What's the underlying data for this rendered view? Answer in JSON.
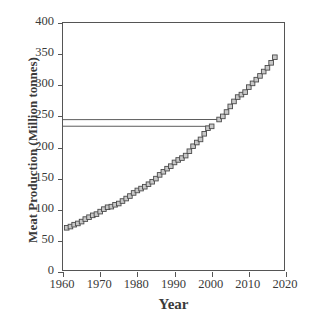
{
  "chart_data": {
    "type": "line",
    "title": "",
    "xlabel": "Year",
    "ylabel": "Meat Production (Million tonnes)",
    "xlim": [
      1960,
      2020
    ],
    "ylim": [
      0,
      400
    ],
    "xticks": [
      1960,
      1970,
      1980,
      1990,
      2000,
      2010,
      2020
    ],
    "xticklabels": [
      "1960",
      "1970",
      "1980",
      "1990",
      "2000",
      "2010",
      "2020"
    ],
    "yticks": [
      0,
      50,
      100,
      150,
      200,
      250,
      300,
      350,
      400
    ],
    "yticklabels": [
      "0",
      "50",
      "100",
      "150",
      "200",
      "250",
      "300",
      "350",
      "400"
    ],
    "grid": false,
    "legend": null,
    "marker": "square",
    "marker_facecolor": "#c8c8c8",
    "marker_edgecolor": "#4a4a4a",
    "line_color": "#4a4a4a",
    "series": [
      {
        "name": "Global meat production",
        "x": [
          1961,
          1962,
          1963,
          1964,
          1965,
          1966,
          1967,
          1968,
          1969,
          1970,
          1971,
          1972,
          1973,
          1974,
          1975,
          1976,
          1977,
          1978,
          1979,
          1980,
          1981,
          1982,
          1983,
          1984,
          1985,
          1986,
          1987,
          1988,
          1989,
          1990,
          1991,
          1992,
          1993,
          1994,
          1995,
          1996,
          1997,
          1998,
          1999,
          2000,
          1000,
          2002,
          2003,
          2004,
          2005,
          2006,
          2007,
          2008,
          2009,
          2010,
          2011,
          2012,
          2013,
          2014,
          2015,
          2016,
          2017
        ],
        "values": [
          71,
          73,
          76,
          78,
          81,
          85,
          88,
          91,
          93,
          97,
          101,
          104,
          105,
          108,
          110,
          114,
          118,
          122,
          127,
          131,
          134,
          137,
          141,
          145,
          150,
          156,
          161,
          166,
          170,
          176,
          180,
          183,
          187,
          194,
          202,
          208,
          213,
          222,
          231,
          234,
          239,
          245,
          250,
          257,
          266,
          274,
          281,
          285,
          289,
          297,
          303,
          309,
          315,
          322,
          328,
          336,
          345
        ]
      }
    ],
    "x_start_note": "1961",
    "x_end_note": "2017"
  },
  "axis": {
    "ytick_labels": [
      "400",
      "350",
      "300",
      "250",
      "200",
      "150",
      "100",
      "50",
      "0"
    ],
    "xtick_labels": [
      "1960",
      "1970",
      "1980",
      "1990",
      "2000",
      "2010",
      "2020"
    ],
    "y_title": "Meat Production (Million tonnes)",
    "x_title": "Year"
  }
}
